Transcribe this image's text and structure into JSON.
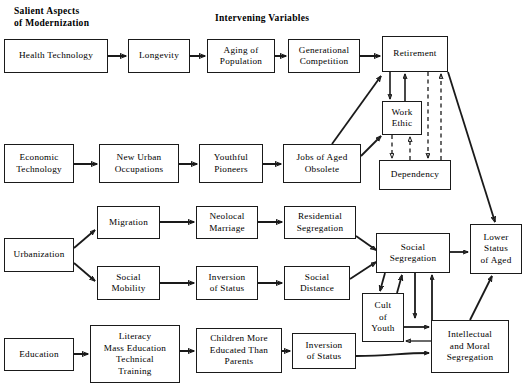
{
  "figure": {
    "type": "flowchart",
    "headers": [
      {
        "name": "salient-aspects-header",
        "text": "Salient Aspects\nof Modernization",
        "x": 14,
        "y": 5
      },
      {
        "name": "intervening-variables-header",
        "text": "Intervening Variables",
        "x": 215,
        "y": 12
      }
    ],
    "nodes": [
      {
        "id": "health-technology",
        "label": "Health Technology",
        "x": 4,
        "y": 39,
        "w": 104,
        "h": 34
      },
      {
        "id": "longevity",
        "label": "Longevity",
        "x": 128,
        "y": 39,
        "w": 62,
        "h": 34
      },
      {
        "id": "aging-of-population",
        "label": "Aging of\nPopulation",
        "x": 207,
        "y": 39,
        "w": 68,
        "h": 34
      },
      {
        "id": "generational-competition",
        "label": "Generational\nCompetition",
        "x": 288,
        "y": 39,
        "w": 72,
        "h": 34
      },
      {
        "id": "retirement",
        "label": "Retirement",
        "x": 382,
        "y": 36,
        "w": 66,
        "h": 36
      },
      {
        "id": "work-ethic",
        "label": "Work\nEthic",
        "x": 382,
        "y": 101,
        "w": 40,
        "h": 34
      },
      {
        "id": "dependency",
        "label": "Dependency",
        "x": 379,
        "y": 160,
        "w": 72,
        "h": 30
      },
      {
        "id": "economic-technology",
        "label": "Economic\nTechnology",
        "x": 4,
        "y": 144,
        "w": 70,
        "h": 39
      },
      {
        "id": "new-urban-occupations",
        "label": "New Urban\nOccupations",
        "x": 99,
        "y": 144,
        "w": 80,
        "h": 39
      },
      {
        "id": "youthful-pioneers",
        "label": "Youthful\nPioneers",
        "x": 199,
        "y": 144,
        "w": 64,
        "h": 39
      },
      {
        "id": "jobs-of-aged-obsolete",
        "label": "Jobs of Aged\nObsolete",
        "x": 283,
        "y": 144,
        "w": 78,
        "h": 39
      },
      {
        "id": "urbanization",
        "label": "Urbanization",
        "x": 4,
        "y": 238,
        "w": 70,
        "h": 34
      },
      {
        "id": "migration",
        "label": "Migration",
        "x": 97,
        "y": 206,
        "w": 63,
        "h": 33
      },
      {
        "id": "neolocal-marriage",
        "label": "Neolocal\nMarriage",
        "x": 196,
        "y": 206,
        "w": 62,
        "h": 33
      },
      {
        "id": "residential-segregation",
        "label": "Residential\nSegregation",
        "x": 284,
        "y": 206,
        "w": 72,
        "h": 33
      },
      {
        "id": "social-mobility",
        "label": "Social\nMobility",
        "x": 97,
        "y": 266,
        "w": 63,
        "h": 34
      },
      {
        "id": "inversion-of-status-mid",
        "label": "Inversion\nof Status",
        "x": 196,
        "y": 266,
        "w": 62,
        "h": 34
      },
      {
        "id": "social-distance",
        "label": "Social\nDistance",
        "x": 284,
        "y": 266,
        "w": 66,
        "h": 34
      },
      {
        "id": "social-segregation",
        "label": "Social\nSegregation",
        "x": 376,
        "y": 233,
        "w": 74,
        "h": 40
      },
      {
        "id": "lower-status-of-aged",
        "label": "Lower\nStatus\nof Aged",
        "x": 470,
        "y": 224,
        "w": 52,
        "h": 50
      },
      {
        "id": "cult-of-youth",
        "label": "Cult\nof\nYouth",
        "x": 362,
        "y": 293,
        "w": 42,
        "h": 49
      },
      {
        "id": "intellectual-moral-segregation",
        "label": "Intellectual\nand Moral\nSegregation",
        "x": 431,
        "y": 320,
        "w": 78,
        "h": 53
      },
      {
        "id": "education",
        "label": "Education",
        "x": 4,
        "y": 338,
        "w": 70,
        "h": 33
      },
      {
        "id": "literacy-mass-education",
        "label": "Literacy\nMass Education\nTechnical\nTraining",
        "x": 90,
        "y": 325,
        "w": 90,
        "h": 58
      },
      {
        "id": "children-more-educated",
        "label": "Children More\nEducated Than\nParents",
        "x": 196,
        "y": 328,
        "w": 86,
        "h": 45
      },
      {
        "id": "inversion-of-status-bot",
        "label": "Inversion\nof Status",
        "x": 292,
        "y": 333,
        "w": 64,
        "h": 36
      }
    ],
    "edges": [
      {
        "from": "health-technology",
        "to": "longevity",
        "style": "solid"
      },
      {
        "from": "longevity",
        "to": "aging-of-population",
        "style": "solid"
      },
      {
        "from": "aging-of-population",
        "to": "generational-competition",
        "style": "solid"
      },
      {
        "from": "generational-competition",
        "to": "retirement",
        "style": "solid"
      },
      {
        "from": "retirement",
        "to": "work-ethic",
        "style": "solid"
      },
      {
        "from": "work-ethic",
        "to": "retirement",
        "style": "solid"
      },
      {
        "from": "dependency",
        "to": "retirement",
        "style": "dashed"
      },
      {
        "from": "retirement",
        "to": "dependency",
        "style": "dashed"
      },
      {
        "from": "work-ethic",
        "to": "dependency",
        "style": "dashed"
      },
      {
        "from": "dependency",
        "to": "work-ethic",
        "style": "dashed"
      },
      {
        "from": "economic-technology",
        "to": "new-urban-occupations",
        "style": "solid"
      },
      {
        "from": "new-urban-occupations",
        "to": "youthful-pioneers",
        "style": "solid"
      },
      {
        "from": "youthful-pioneers",
        "to": "jobs-of-aged-obsolete",
        "style": "solid"
      },
      {
        "from": "jobs-of-aged-obsolete",
        "to": "retirement",
        "style": "solid"
      },
      {
        "from": "jobs-of-aged-obsolete",
        "to": "work-ethic",
        "style": "solid"
      },
      {
        "from": "retirement",
        "to": "lower-status-of-aged",
        "style": "solid"
      },
      {
        "from": "urbanization",
        "to": "migration",
        "style": "solid"
      },
      {
        "from": "urbanization",
        "to": "social-mobility",
        "style": "solid"
      },
      {
        "from": "migration",
        "to": "neolocal-marriage",
        "style": "solid"
      },
      {
        "from": "neolocal-marriage",
        "to": "residential-segregation",
        "style": "solid"
      },
      {
        "from": "residential-segregation",
        "to": "social-segregation",
        "style": "solid"
      },
      {
        "from": "social-mobility",
        "to": "inversion-of-status-mid",
        "style": "solid"
      },
      {
        "from": "inversion-of-status-mid",
        "to": "social-distance",
        "style": "solid"
      },
      {
        "from": "social-distance",
        "to": "social-segregation",
        "style": "solid"
      },
      {
        "from": "social-segregation",
        "to": "lower-status-of-aged",
        "style": "solid"
      },
      {
        "from": "social-segregation",
        "to": "cult-of-youth",
        "style": "solid"
      },
      {
        "from": "cult-of-youth",
        "to": "social-segregation",
        "style": "solid"
      },
      {
        "from": "social-segregation",
        "to": "intellectual-moral-segregation",
        "style": "solid"
      },
      {
        "from": "intellectual-moral-segregation",
        "to": "social-segregation",
        "style": "solid"
      },
      {
        "from": "cult-of-youth",
        "to": "intellectual-moral-segregation",
        "style": "solid"
      },
      {
        "from": "intellectual-moral-segregation",
        "to": "cult-of-youth",
        "style": "solid"
      },
      {
        "from": "intellectual-moral-segregation",
        "to": "lower-status-of-aged",
        "style": "solid"
      },
      {
        "from": "education",
        "to": "literacy-mass-education",
        "style": "solid"
      },
      {
        "from": "literacy-mass-education",
        "to": "children-more-educated",
        "style": "solid"
      },
      {
        "from": "children-more-educated",
        "to": "inversion-of-status-bot",
        "style": "solid"
      },
      {
        "from": "inversion-of-status-bot",
        "to": "intellectual-moral-segregation",
        "style": "solid"
      }
    ],
    "colors": {
      "stroke": "#1a1a1a",
      "background": "#ffffff",
      "text": "#000000"
    }
  }
}
